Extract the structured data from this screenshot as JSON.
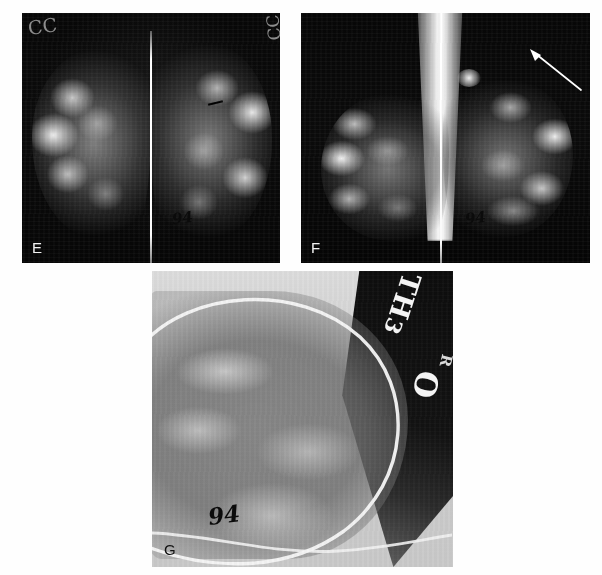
{
  "figure": {
    "kind": "radiology-figure",
    "background_color": "#ffffff",
    "width": 602,
    "height": 575,
    "panel_count": 3
  },
  "panels": [
    {
      "letter": "E",
      "name": "panel-e",
      "view": "bilateral craniocaudal (CC) mammogram",
      "letter_color": "#f2f2f2",
      "background_color": "#070707",
      "film_markers": [
        {
          "text": "CC",
          "position": "top-left"
        },
        {
          "text": "CC",
          "position": "top-right"
        }
      ],
      "handwritten": [
        {
          "text": "94",
          "position": "lower-right-of-midline"
        }
      ],
      "annotations": [
        {
          "type": "dash-marker",
          "color": "#000000"
        }
      ]
    },
    {
      "letter": "F",
      "name": "panel-f",
      "view": "bilateral mediolateral oblique (MLO) mammogram",
      "letter_color": "#f2f2f2",
      "background_color": "#070707",
      "film_markers": [],
      "handwritten": [
        {
          "text": "94",
          "position": "lower-center"
        }
      ],
      "annotations": [
        {
          "type": "arrow",
          "color": "#ffffff",
          "direction": "up-left",
          "position": "upper-right"
        }
      ]
    },
    {
      "letter": "G",
      "name": "panel-g",
      "view": "magnified coned-down spot view",
      "letter_color": "#111111",
      "background_color": "#d8d8d8",
      "film_markers": [
        {
          "text": "TH",
          "position": "upper-right-rotated"
        },
        {
          "text": "3",
          "position": "upper-right-rotated"
        },
        {
          "text": "O",
          "position": "mid-right-rotated"
        },
        {
          "text": "R",
          "position": "mid-right-rotated"
        }
      ],
      "handwritten": [
        {
          "text": "94",
          "position": "lower-left"
        }
      ],
      "annotations": []
    }
  ],
  "labels": {
    "panel_e": "E",
    "panel_f": "F",
    "panel_g": "G"
  },
  "marks": {
    "cc_left": "CC",
    "cc_right": "CC",
    "year_e": "94",
    "year_f": "94",
    "year_g": "94",
    "g_th": "TH",
    "g_three": "3",
    "g_o": "O",
    "g_r": "R"
  },
  "colors": {
    "page_background": "#ffffff",
    "film_black": "#070707",
    "film_light_gray": "#d8d8d8",
    "marker_white": "#ffffff",
    "handwriting_ink": "#0b0b0b",
    "label_light": "#f2f2f2",
    "label_dark": "#111111"
  }
}
